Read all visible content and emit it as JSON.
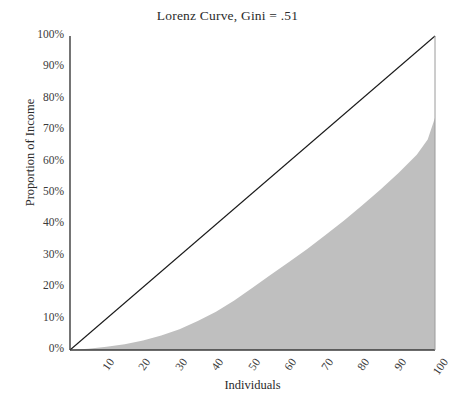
{
  "chart_data": {
    "type": "area",
    "title": "Lorenz Curve, Gini = .51",
    "xlabel": "Individuals",
    "ylabel": "Proportion of Income",
    "xlim": [
      0,
      100
    ],
    "ylim": [
      0,
      100
    ],
    "grid": false,
    "legend": "none",
    "gini": 0.51,
    "fill_color": "#bfbfbf",
    "line_color": "#1a1a1a",
    "axis_color": "#3a3a3a",
    "y_tick_labels": [
      "0%",
      "10%",
      "20%",
      "30%",
      "40%",
      "50%",
      "60%",
      "70%",
      "80%",
      "90%",
      "100%"
    ],
    "y_tick_values": [
      0,
      10,
      20,
      30,
      40,
      50,
      60,
      70,
      80,
      90,
      100
    ],
    "x_tick_labels": [
      "10",
      "20",
      "30",
      "40",
      "50",
      "60",
      "70",
      "80",
      "90",
      "100"
    ],
    "x_tick_values": [
      10,
      20,
      30,
      40,
      50,
      60,
      70,
      80,
      90,
      100
    ],
    "series": [
      {
        "name": "Lorenz curve",
        "kind": "area",
        "x": [
          0,
          5,
          10,
          15,
          20,
          25,
          30,
          35,
          40,
          45,
          50,
          55,
          60,
          65,
          70,
          75,
          80,
          85,
          90,
          95,
          98,
          100
        ],
        "values": [
          0,
          0.4,
          1.0,
          1.8,
          3.0,
          4.6,
          6.6,
          9.2,
          12.2,
          15.8,
          19.8,
          24.0,
          28.0,
          32.2,
          36.6,
          41.2,
          46.0,
          51.0,
          56.4,
          62.2,
          67.0,
          74.0
        ]
      },
      {
        "name": "Line of equality",
        "kind": "line",
        "x": [
          0,
          100
        ],
        "values": [
          0,
          100
        ]
      }
    ]
  }
}
